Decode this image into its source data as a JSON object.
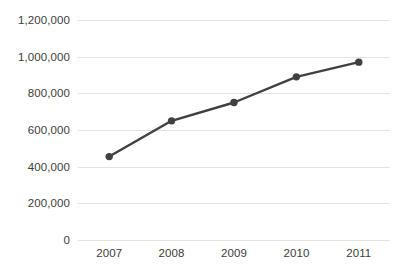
{
  "chart_data": {
    "type": "line",
    "title": "",
    "subtitle": "",
    "xlabel": "",
    "ylabel": "",
    "categories": [
      "2007",
      "2008",
      "2009",
      "2010",
      "2011"
    ],
    "values": [
      455000,
      650000,
      750000,
      890000,
      970000
    ],
    "series": [
      {
        "name": "Series 1",
        "values": [
          455000,
          650000,
          750000,
          890000,
          970000
        ]
      }
    ],
    "ylim": [
      0,
      1200000
    ],
    "y_ticks": [
      0,
      200000,
      400000,
      600000,
      800000,
      1000000,
      1200000
    ],
    "y_tick_labels": [
      "0",
      "200,000",
      "400,000",
      "600,000",
      "800,000",
      "1,000,000",
      "1,200,000"
    ],
    "x_tick_labels": [
      "2007",
      "2008",
      "2009",
      "2010",
      "2011"
    ],
    "grid": true,
    "grid_axis": "y",
    "legend": false,
    "legend_position": "none",
    "annotations": [],
    "colors": {
      "line": "#404040",
      "marker": "#404040",
      "gridline": "#e3e3e3",
      "tick_label": "#3d3d3d",
      "background": "#ffffff"
    },
    "marker_style": "circle",
    "line_width": 2.4,
    "marker_size": 5
  }
}
